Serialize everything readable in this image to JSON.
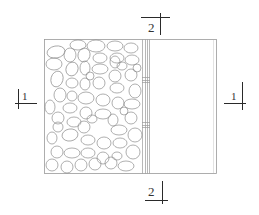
{
  "drawing": {
    "type": "section-plan",
    "colors": {
      "background": "#ffffff",
      "line": "#9a9a9a",
      "marker": "#2a2a2a",
      "stone": "#8c8c8c"
    },
    "section_markers": [
      {
        "id": "section-2-top",
        "label": "2"
      },
      {
        "id": "section-2-bottom",
        "label": "2"
      },
      {
        "id": "section-1-left",
        "label": "1"
      },
      {
        "id": "section-1-right",
        "label": "1"
      }
    ],
    "regions": {
      "left": "rubble-stone-fill",
      "middle": "wall-layers",
      "right": "empty-panel"
    }
  }
}
